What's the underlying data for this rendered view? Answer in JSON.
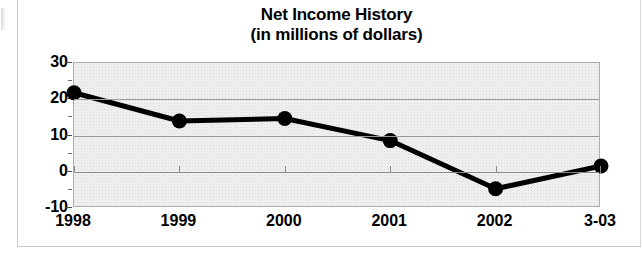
{
  "chart_data": {
    "type": "line",
    "title": "Net Income History",
    "subtitle": "(in millions of dollars)",
    "xlabel": "",
    "ylabel": "",
    "categories": [
      "1998",
      "1999",
      "2000",
      "2001",
      "2002",
      "3-03"
    ],
    "values": [
      21.8,
      14.0,
      14.7,
      8.6,
      -4.7,
      1.6
    ],
    "series": [
      {
        "name": "Net Income",
        "values": [
          21.8,
          14.0,
          14.7,
          8.6,
          -4.7,
          1.6
        ]
      }
    ],
    "ylim": [
      -10,
      30
    ],
    "ytick_labels": [
      "30",
      "20",
      "10",
      "0",
      "-10"
    ],
    "ytick_values": [
      30,
      20,
      10,
      0,
      -10
    ],
    "yminor_tick_values": [
      25,
      15,
      5,
      -5
    ],
    "gridlines": [
      20,
      10,
      0
    ],
    "grid": true,
    "legend": "none",
    "marker": "circle",
    "line_color": "#000000",
    "marker_color": "#000000",
    "plot_background": "#f2f2f2",
    "plot_border_color": "#adadad"
  },
  "titles": {
    "line1": "Net Income History",
    "line2": "(in millions of dollars)"
  }
}
